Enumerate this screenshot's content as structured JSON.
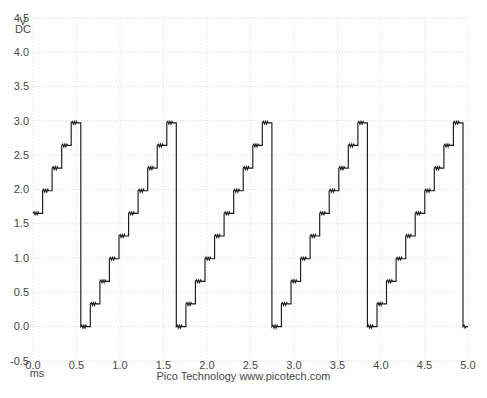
{
  "footer": {
    "brand": "Pico Technology www.picotech.com"
  },
  "axes": {
    "y_unit": "V",
    "y_coupling": "DC",
    "x_unit": "ms"
  },
  "chart_data": {
    "type": "line",
    "subtype": "oscilloscope-staircase-sawtooth",
    "title": "",
    "xlabel": "ms",
    "ylabel": "V DC",
    "xlim_ms": [
      0,
      5
    ],
    "ylim_v": [
      -0.5,
      4.5
    ],
    "x_ticks_ms": [
      "0.0",
      "0.5",
      "1.0",
      "1.5",
      "2.0",
      "2.5",
      "3.0",
      "3.5",
      "4.0",
      "4.5",
      "5.0"
    ],
    "y_ticks_v": [
      "4.5",
      "4.0",
      "3.5",
      "3.0",
      "2.5",
      "2.0",
      "1.5",
      "1.0",
      "0.5",
      "0.0",
      "-0.5"
    ],
    "grid": true,
    "legend": false,
    "series": [
      {
        "name": "channel-a",
        "waveform": "repeating 10-step staircase ramp 0 V to 2.97 V with reset to 0 V",
        "levels_v": [
          0,
          0.33,
          0.66,
          0.99,
          1.32,
          1.65,
          1.98,
          2.31,
          2.64,
          2.97
        ],
        "step_width_ms": 0.10983,
        "period_ms": 1.0983,
        "first_drop_ms": 0.5492,
        "drop_times_ms": [
          0.5492,
          1.6475,
          2.7458,
          3.8441,
          4.9424
        ],
        "start_level_index": 5,
        "ripple_v": 0.02,
        "ripple_fraction_of_step": 0.62
      }
    ],
    "colors": {
      "trace": "#1b1b1b",
      "grid": "#d9d9d9",
      "text": "#474747",
      "background": "#ffffff"
    }
  }
}
